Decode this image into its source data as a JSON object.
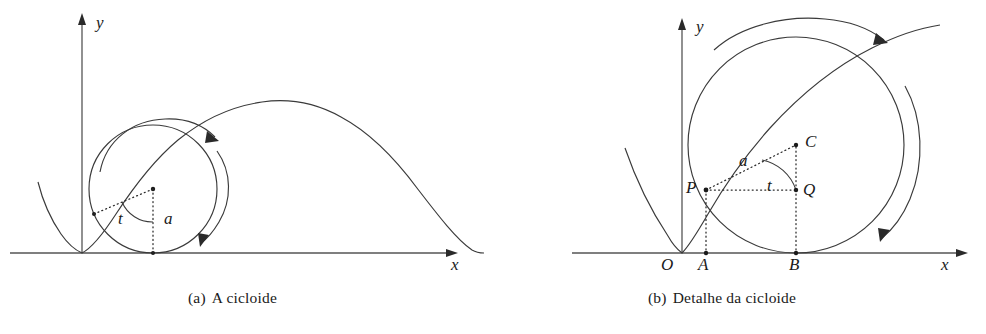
{
  "document": {
    "type": "mathematical-figure",
    "subject": "cycloid",
    "language": "pt-BR",
    "background_color": "#ffffff",
    "ink_color": "#1a1a1a"
  },
  "figures": [
    {
      "id": "figure-a",
      "caption_tag": "(a)",
      "caption_text": "A cicloide",
      "caption_full": "(a) A cicloide",
      "axes": {
        "x_label": "x",
        "y_label": "y",
        "origin": {
          "x": 82,
          "y": 253
        },
        "x_axis": {
          "x1": 10,
          "y1": 253,
          "x2": 448,
          "y2": 253
        },
        "y_axis": {
          "x1": 82,
          "y1": 253,
          "x2": 82,
          "y2": 17
        }
      },
      "circle": {
        "center": {
          "x": 153,
          "y": 189
        },
        "radius": 64,
        "radius_label": "a",
        "angle_label": "t",
        "center_dot": true,
        "ground_contact": {
          "x": 153,
          "y": 253
        }
      },
      "cycloid": {
        "radius": 64,
        "arch_start_x": 82,
        "arch_count": 1.5,
        "peak": {
          "x": 287,
          "y": 125
        },
        "arch_end": {
          "x": 484,
          "y": 253
        }
      },
      "rotation_arrows": 2
    },
    {
      "id": "figure-b",
      "caption_tag": "(b)",
      "caption_text": "Detalhe da cicloide",
      "caption_full": "(b) Detalhe da cicloide",
      "axes": {
        "x_label": "x",
        "y_label": "y",
        "origin": {
          "x": 682,
          "y": 253
        },
        "x_axis": {
          "x1": 572,
          "y1": 253,
          "x2": 963,
          "y2": 253
        },
        "y_axis": {
          "x1": 682,
          "y1": 253,
          "x2": 682,
          "y2": 22
        }
      },
      "circle": {
        "center": {
          "x": 796,
          "y": 145
        },
        "radius": 108,
        "radius_label": "a",
        "angle_label": "t"
      },
      "points": [
        {
          "name": "O",
          "label": "O",
          "x": 682,
          "y": 253,
          "label_x": 663,
          "label_y": 259,
          "dot": false
        },
        {
          "name": "A",
          "label": "A",
          "x": 706,
          "y": 253,
          "label_x": 699,
          "label_y": 259,
          "dot": true
        },
        {
          "name": "B",
          "label": "B",
          "x": 796,
          "y": 253,
          "label_x": 789,
          "label_y": 259,
          "dot": true
        },
        {
          "name": "P",
          "label": "P",
          "x": 706,
          "y": 190,
          "label_x": 688,
          "label_y": 181,
          "dot": true
        },
        {
          "name": "Q",
          "label": "Q",
          "x": 796,
          "y": 190,
          "label_x": 804,
          "label_y": 182,
          "dot": true
        },
        {
          "name": "C",
          "label": "C",
          "x": 796,
          "y": 145,
          "label_x": 806,
          "label_y": 134,
          "dot": true
        }
      ],
      "segments": [
        {
          "name": "PC",
          "from": "P",
          "to": "C",
          "style": "dotted",
          "label": "a"
        },
        {
          "name": "PQ",
          "from": "P",
          "to": "Q",
          "style": "dotted"
        },
        {
          "name": "QC",
          "from": "Q",
          "to": "C",
          "style": "dotted"
        },
        {
          "name": "PA",
          "from": "P",
          "to": "A",
          "style": "dotted"
        },
        {
          "name": "QB",
          "from": "Q",
          "to": "B",
          "style": "dotted"
        }
      ],
      "angle": {
        "label": "t",
        "vertex": "C",
        "label_x": 768,
        "label_y": 177
      },
      "radius_label_pos": {
        "label": "a",
        "x": 740,
        "y": 152
      },
      "rotation_arrows": 2
    }
  ],
  "labels": {
    "a_left_radius": "a",
    "a_left_angle": "t",
    "x_axis": "x",
    "y_axis": "y"
  }
}
